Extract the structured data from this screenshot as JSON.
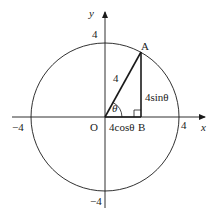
{
  "diagram": {
    "axes": {
      "x_label": "x",
      "y_label": "y",
      "x_ticks": {
        "neg": "−4",
        "pos": "4"
      },
      "y_ticks": {
        "pos": "4",
        "neg": "−4"
      }
    },
    "circle": {
      "radius_value": "4"
    },
    "points": {
      "origin": "O",
      "A": "A",
      "B": "B"
    },
    "segments": {
      "hypotenuse": "4",
      "adjacent": "4cosθ",
      "opposite": "4sinθ"
    },
    "angle": "θ",
    "colors": {
      "stroke": "#1a1a1a",
      "background": "#ffffff"
    }
  }
}
